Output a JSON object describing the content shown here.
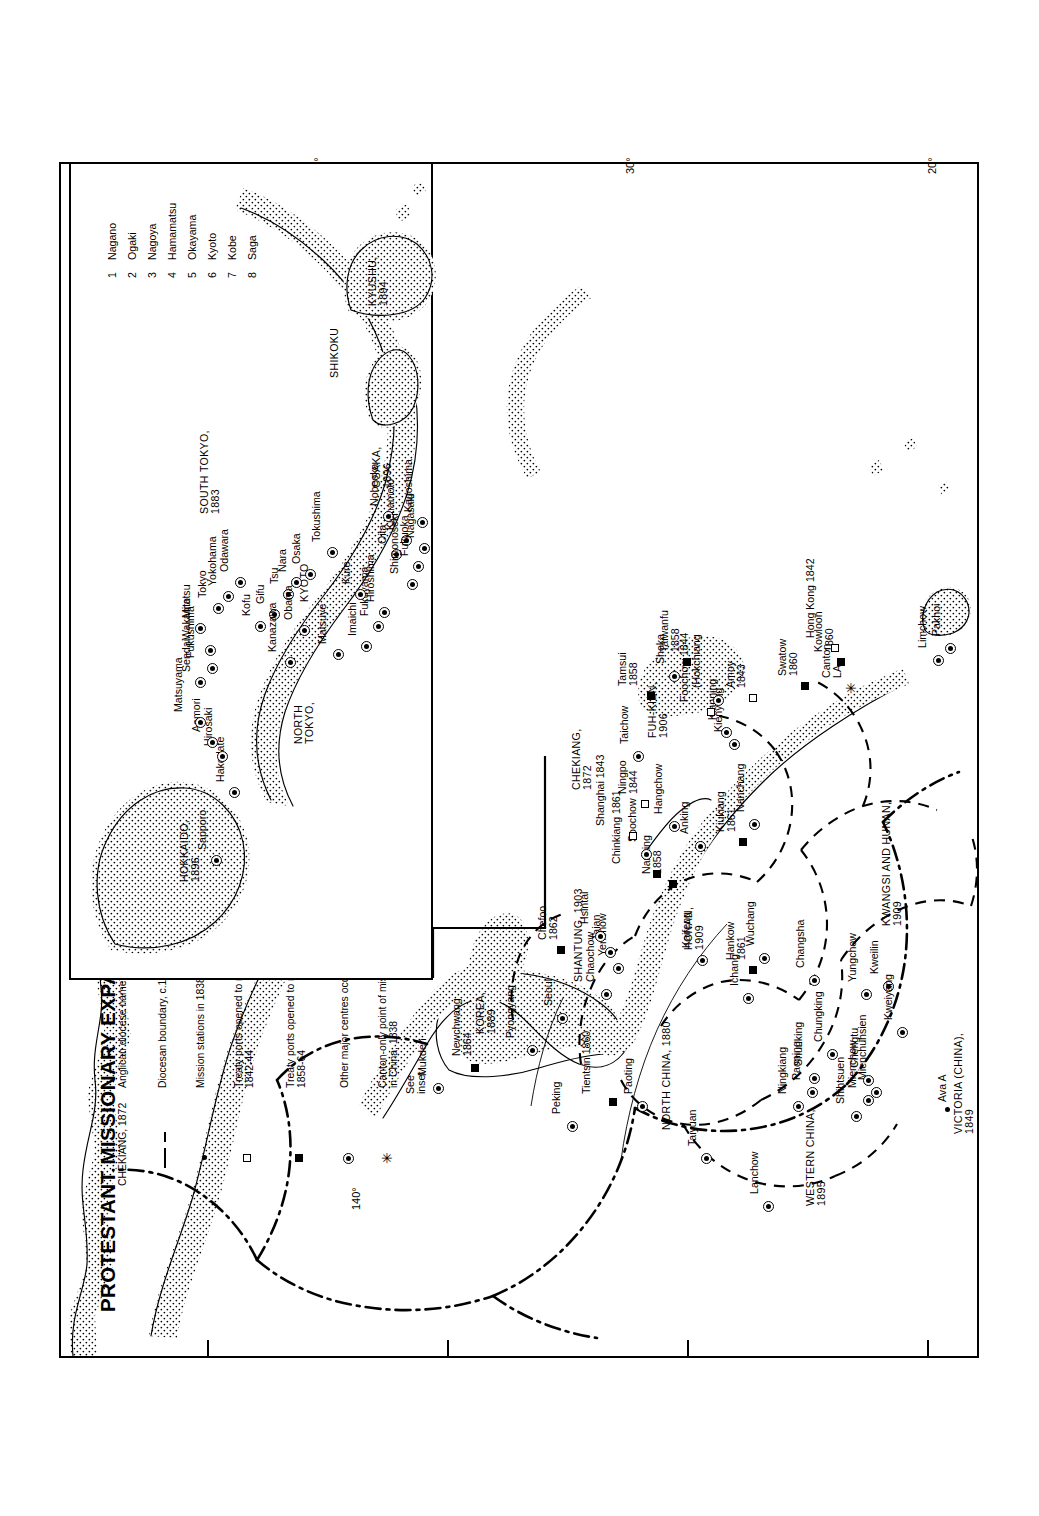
{
  "map": {
    "title": "PROTESTANT MISSIONARY EXPANSION IN THE FAR EAST AND SOUTH-EAST ASIA TO 1914",
    "see_inset": "See\ninset",
    "graticule": {
      "longitudes": [
        "140°"
      ],
      "latitudes": [
        "40°",
        "30°",
        "20°"
      ]
    }
  },
  "legend": {
    "symbols": [
      {
        "key": "CHEKIANG, 1872",
        "symbol": "diocese-name",
        "label": "Anglican diocese name and date of creation"
      },
      {
        "key": "",
        "symbol": "dashed-line",
        "label": "Diocesan boundary, c.1912"
      },
      {
        "key": "",
        "symbol": "small-dot",
        "label": "Mission stations in 1838"
      },
      {
        "key": "",
        "symbol": "open-square",
        "label": "Treaty ports opened to missionaries,\n1842-44"
      },
      {
        "key": "",
        "symbol": "filled-square",
        "label": "Treaty ports opened to missionaries,\n1858-64"
      },
      {
        "key": "",
        "symbol": "circled-dot",
        "label": "Other major centres occupied by c.1910"
      },
      {
        "key": "",
        "symbol": "star",
        "label": "Canton-only point of missionary activity\nin China, 1838"
      }
    ],
    "societies": [
      {
        "code": "A",
        "name": "North American Missions"
      },
      {
        "code": "B",
        "name": "Baptist Missionary Society"
      },
      {
        "code": "C",
        "name": "Church Missionary Society"
      },
      {
        "code": "L",
        "name": "London Missionary Society"
      },
      {
        "code": "N",
        "name": "Netherlands Missionary Society"
      },
      {
        "code": "R",
        "name": "Rhenish Missionary Society"
      },
      {
        "code": "S",
        "name": "Society for the Propagation of the Gospel"
      }
    ]
  },
  "dioceses": [
    {
      "name": "HOKKAIDO,\n1896"
    },
    {
      "name": "NORTH\nTOKYO,"
    },
    {
      "name": "SOUTH TOKYO,\n1883"
    },
    {
      "name": "KYOTO"
    },
    {
      "name": "OSAKA,\n1896"
    },
    {
      "name": "SHIKOKU"
    },
    {
      "name": "KYUSHU,\n1894"
    },
    {
      "name": "KOREA,\n1889"
    },
    {
      "name": "NORTH CHINA, 1880"
    },
    {
      "name": "SHANTUNG, 1903"
    },
    {
      "name": "HONAN,\n1909"
    },
    {
      "name": "WESTERN CHINA,\n1895"
    },
    {
      "name": "CHEKIANG,\n1872"
    },
    {
      "name": "FUH-KIEN,\n1906"
    },
    {
      "name": "KWANGSI AND HUNAN,\n1909"
    },
    {
      "name": "VICTORIA (CHINA),\n1849"
    }
  ],
  "inset_numbers": [
    {
      "n": "1",
      "name": "Nagano"
    },
    {
      "n": "2",
      "name": "Ogaki"
    },
    {
      "n": "3",
      "name": "Nagoya"
    },
    {
      "n": "4",
      "name": "Hamamatsu"
    },
    {
      "n": "5",
      "name": "Okayama"
    },
    {
      "n": "6",
      "name": "Kyoto"
    },
    {
      "n": "7",
      "name": "Kobe"
    },
    {
      "n": "8",
      "name": "Saga"
    }
  ],
  "places": {
    "japan_inset": [
      {
        "label": "Sapporo",
        "symbol": "circled-dot"
      },
      {
        "label": "Hakodate",
        "symbol": "circled-dot"
      },
      {
        "label": "Hirosaki",
        "symbol": "circled-dot"
      },
      {
        "label": "Aomori",
        "symbol": "circled-dot"
      },
      {
        "label": "Matsuyama",
        "symbol": "circled-dot"
      },
      {
        "label": "Sendai",
        "symbol": "circled-dot"
      },
      {
        "label": "Fukushima",
        "symbol": "circled-dot"
      },
      {
        "label": "Wakamatsu",
        "symbol": "circled-dot"
      },
      {
        "label": "Mito",
        "symbol": "circled-dot"
      },
      {
        "label": "Tokyo",
        "symbol": "circled-dot"
      },
      {
        "label": "Yokohama",
        "symbol": "circled-dot"
      },
      {
        "label": "Odawara",
        "symbol": "circled-dot"
      },
      {
        "label": "Kofu",
        "symbol": "circled-dot"
      },
      {
        "label": "Gifu",
        "symbol": "circled-dot"
      },
      {
        "label": "Tsu",
        "symbol": "circled-dot"
      },
      {
        "label": "Nara",
        "symbol": "circled-dot"
      },
      {
        "label": "Osaka",
        "symbol": "circled-dot"
      },
      {
        "label": "Kanazawa",
        "symbol": "circled-dot"
      },
      {
        "label": "Obama",
        "symbol": "circled-dot"
      },
      {
        "label": "Matsuye",
        "symbol": "circled-dot"
      },
      {
        "label": "Imaichi",
        "symbol": "circled-dot"
      },
      {
        "label": "Fukuyama",
        "symbol": "circled-dot"
      },
      {
        "label": "Hiroshima",
        "symbol": "circled-dot"
      },
      {
        "label": "Kure",
        "symbol": "circled-dot"
      },
      {
        "label": "Tokushima",
        "symbol": "circled-dot"
      },
      {
        "label": "Oita",
        "symbol": "circled-dot"
      },
      {
        "label": "Kumamoto",
        "symbol": "circled-dot"
      },
      {
        "label": "Nobeoka",
        "symbol": "circled-dot"
      },
      {
        "label": "Shimonoseki",
        "symbol": "circled-dot"
      },
      {
        "label": "Fukuoka",
        "symbol": "circled-dot"
      },
      {
        "label": "Nagasaki",
        "symbol": "circled-dot"
      },
      {
        "label": "Kagoshima",
        "symbol": "circled-dot"
      }
    ],
    "mainland": [
      {
        "label": "Mukden",
        "symbol": "circled-dot"
      },
      {
        "label": "Newchwang\n1864",
        "symbol": "filled-square"
      },
      {
        "label": "Pyongyang",
        "symbol": "circled-dot"
      },
      {
        "label": "Seoul",
        "symbol": "circled-dot"
      },
      {
        "label": "Peking",
        "symbol": "circled-dot"
      },
      {
        "label": "Tientsin 1860",
        "symbol": "filled-square"
      },
      {
        "label": "Paoting",
        "symbol": "circled-dot"
      },
      {
        "label": "Taiyuan",
        "symbol": "circled-dot"
      },
      {
        "label": "Chefoo\n1862",
        "symbol": "filled-square"
      },
      {
        "label": "Chaochow",
        "symbol": "circled-dot"
      },
      {
        "label": "Yenchow",
        "symbol": "circled-dot"
      },
      {
        "label": "Taian",
        "symbol": "circled-dot"
      },
      {
        "label": "Hsintai",
        "symbol": "circled-dot"
      },
      {
        "label": "Kaifeng",
        "symbol": "circled-dot"
      },
      {
        "label": "Lanchow",
        "symbol": "circled-dot"
      },
      {
        "label": "Ningkiang",
        "symbol": "circled-dot"
      },
      {
        "label": "Paoning",
        "symbol": "circled-dot"
      },
      {
        "label": "Shunking",
        "symbol": "circled-dot"
      },
      {
        "label": "Shihtsuen",
        "symbol": "circled-dot"
      },
      {
        "label": "Mienchow",
        "symbol": "circled-dot"
      },
      {
        "label": "Mienchuhsien",
        "symbol": "circled-dot"
      },
      {
        "label": "Chengtu",
        "symbol": "circled-dot"
      },
      {
        "label": "Chungking",
        "symbol": "circled-dot"
      },
      {
        "label": "Ichang",
        "symbol": "circled-dot"
      },
      {
        "label": "Hankow\n1861",
        "symbol": "filled-square"
      },
      {
        "label": "Wuchang",
        "symbol": "circled-dot"
      },
      {
        "label": "Changsha",
        "symbol": "circled-dot"
      },
      {
        "label": "Yungchow",
        "symbol": "circled-dot"
      },
      {
        "label": "Kweilin",
        "symbol": "circled-dot"
      },
      {
        "label": "Kweiyang",
        "symbol": "circled-dot"
      },
      {
        "label": "Nanking\n1858",
        "symbol": "filled-square"
      },
      {
        "label": "Chinkiang 1861",
        "symbol": "filled-square"
      },
      {
        "label": "Soochow",
        "symbol": "circled-dot"
      },
      {
        "label": "Shanghai 1843",
        "symbol": "open-square"
      },
      {
        "label": "Anking",
        "symbol": "circled-dot"
      },
      {
        "label": "Hangchow",
        "symbol": "circled-dot"
      },
      {
        "label": "Ningpo\n1844",
        "symbol": "open-square"
      },
      {
        "label": "Kiukiang\n1861",
        "symbol": "filled-square"
      },
      {
        "label": "Nanchang",
        "symbol": "circled-dot"
      },
      {
        "label": "Taichow",
        "symbol": "circled-dot"
      },
      {
        "label": "Kienyang",
        "symbol": "circled-dot"
      },
      {
        "label": "Kianning",
        "symbol": "circled-dot"
      },
      {
        "label": "Foochow 1844",
        "symbol": "open-square"
      },
      {
        "label": "(Hokchiang",
        "symbol": "circled-dot"
      },
      {
        "label": "Tamsui\n1858",
        "symbol": "filled-square"
      },
      {
        "label": "Shoka",
        "symbol": "circled-dot"
      },
      {
        "label": "Taiwanfu\n1858",
        "symbol": "filled-square"
      },
      {
        "label": "Amoy\n1843",
        "symbol": "open-square"
      },
      {
        "label": "Swatow\n1860",
        "symbol": "filled-square"
      },
      {
        "label": "Kowloon\n1860",
        "symbol": "filled-square"
      },
      {
        "label": "Hong Kong 1842",
        "symbol": "open-square"
      },
      {
        "label": "Canton\nLA",
        "symbol": "star"
      },
      {
        "label": "Limchow",
        "symbol": "circled-dot"
      },
      {
        "label": "Pakhoi",
        "symbol": "circled-dot"
      },
      {
        "label": "Ava A",
        "symbol": "small-dot"
      }
    ]
  }
}
